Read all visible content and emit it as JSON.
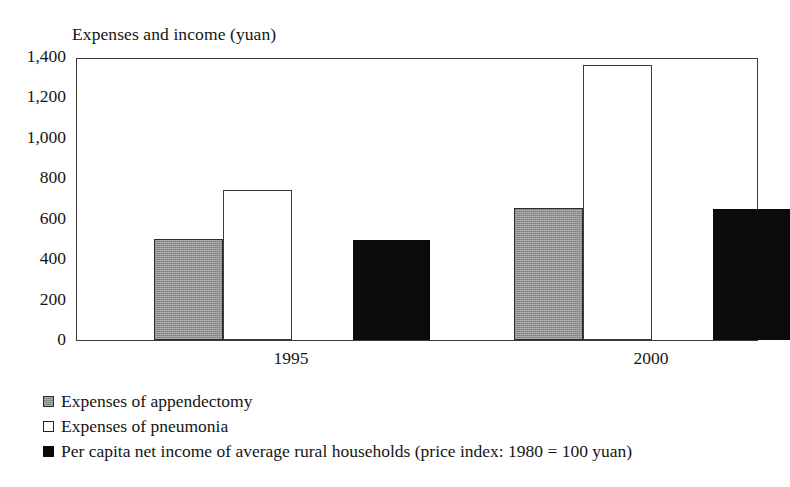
{
  "chart_data": {
    "type": "bar",
    "title": "Expenses and income (yuan)",
    "xlabel": "",
    "ylabel": "Expenses and income (yuan)",
    "categories": [
      "1995",
      "2000"
    ],
    "ylim": [
      0,
      1400
    ],
    "yticks": [
      0,
      200,
      400,
      600,
      800,
      1000,
      1200,
      1400
    ],
    "ytick_labels": [
      "0",
      "200",
      "400",
      "600",
      "800",
      "1,000",
      "1,200",
      "1,400"
    ],
    "grid": false,
    "legend_position": "below-left",
    "series": [
      {
        "name": "Expenses of appendectomy",
        "color": "#8e8e8e",
        "values": [
          500,
          655
        ]
      },
      {
        "name": "Expenses of pneumonia",
        "color": "#ffffff",
        "values": [
          740,
          1360
        ]
      },
      {
        "name": "Per capita net income of average rural households (price index: 1980 = 100 yuan)",
        "color": "#0b0b0b",
        "values": [
          495,
          650
        ]
      }
    ]
  },
  "legend": {
    "items": [
      {
        "label": "Expenses of appendectomy",
        "swatch": "gray-swatch-icon"
      },
      {
        "label": "Expenses of pneumonia",
        "swatch": "white-swatch-icon"
      },
      {
        "label": "Per capita net income of average rural households (price index: 1980 = 100 yuan)",
        "swatch": "black-swatch-icon"
      }
    ]
  }
}
